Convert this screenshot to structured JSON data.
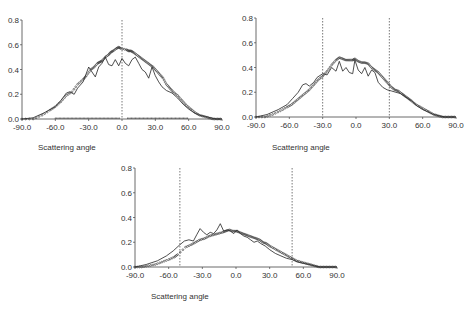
{
  "chart_data": [
    {
      "id": "panel-top-left",
      "type": "line",
      "title": "",
      "xlabel": "Scattering angle",
      "ylabel": "",
      "xlim": [
        -90,
        90
      ],
      "ylim": [
        0,
        0.8
      ],
      "xticks": [
        "-90.0",
        "-60.0",
        "-30.0",
        "0.0",
        "30.0",
        "60.0",
        "90.0"
      ],
      "yticks": [
        "0.0",
        "0.2",
        "0.4",
        "0.6",
        "0.8"
      ],
      "grid": false,
      "legend": "none",
      "vlines": [
        0
      ],
      "box": {
        "x0": 22,
        "x1": 222,
        "y0": 119,
        "y1": 20,
        "label_x": 38,
        "label_y": 150
      },
      "series": [
        {
          "name": "solid-curve",
          "style": "line",
          "x": [
            -90,
            -80,
            -70,
            -60,
            -55,
            -50,
            -47,
            -43,
            -40,
            -35,
            -30,
            -27,
            -24,
            -21,
            -18,
            -15,
            -12,
            -9,
            -6,
            -3,
            0,
            3,
            6,
            9,
            12,
            15,
            18,
            21,
            24,
            27,
            30,
            33,
            36,
            40,
            45,
            50,
            55,
            60,
            65,
            70,
            75,
            80,
            85,
            90
          ],
          "y": [
            0.0,
            0.01,
            0.05,
            0.1,
            0.15,
            0.21,
            0.22,
            0.2,
            0.25,
            0.3,
            0.42,
            0.38,
            0.34,
            0.42,
            0.45,
            0.5,
            0.44,
            0.43,
            0.48,
            0.43,
            0.49,
            0.45,
            0.43,
            0.48,
            0.5,
            0.45,
            0.4,
            0.38,
            0.33,
            0.42,
            0.35,
            0.3,
            0.26,
            0.23,
            0.21,
            0.17,
            0.12,
            0.08,
            0.05,
            0.03,
            0.02,
            0.01,
            0.0,
            0.0
          ]
        },
        {
          "name": "dotted-measurements",
          "style": "points",
          "x": [
            -90,
            -80,
            -72,
            -65,
            -60,
            -55,
            -50,
            -45,
            -40,
            -35,
            -32,
            -28,
            -25,
            -22,
            -20,
            -18,
            -15,
            -12,
            -10,
            -8,
            -5,
            -3,
            -1,
            4,
            6,
            8,
            10,
            13,
            16,
            19,
            22,
            25,
            28,
            31,
            34,
            37,
            40,
            43,
            46,
            50,
            54,
            58,
            62,
            66,
            70,
            74,
            78,
            82,
            86,
            90
          ],
          "y": [
            0.0,
            0.0,
            0.03,
            0.07,
            0.1,
            0.14,
            0.19,
            0.22,
            0.28,
            0.32,
            0.35,
            0.4,
            0.42,
            0.45,
            0.46,
            0.47,
            0.5,
            0.52,
            0.54,
            0.55,
            0.57,
            0.58,
            0.57,
            0.56,
            0.55,
            0.55,
            0.54,
            0.52,
            0.5,
            0.48,
            0.46,
            0.44,
            0.42,
            0.39,
            0.36,
            0.33,
            0.28,
            0.25,
            0.22,
            0.19,
            0.15,
            0.11,
            0.08,
            0.05,
            0.03,
            0.02,
            0.01,
            0.0,
            0.0,
            0.0
          ]
        },
        {
          "name": "baseline-dots",
          "style": "baseline-points",
          "ranges": [
            [
              -60,
              -2
            ],
            [
              5,
              60
            ]
          ]
        }
      ]
    },
    {
      "id": "panel-top-right",
      "type": "line",
      "title": "",
      "xlabel": "Scattering angle",
      "ylabel": "",
      "xlim": [
        -90,
        90
      ],
      "ylim": [
        0,
        0.8
      ],
      "xticks": [
        "-90.0",
        "-60.0",
        "-30.0",
        "0.0",
        "30.0",
        "60.0",
        "90.0"
      ],
      "yticks": [
        "0.0",
        "0.2",
        "0.4",
        "0.6",
        "0.8"
      ],
      "grid": false,
      "legend": "none",
      "vlines": [
        -30,
        30
      ],
      "box": {
        "x0": 256,
        "x1": 456,
        "y0": 117,
        "y1": 18,
        "label_x": 272,
        "label_y": 150
      },
      "series": [
        {
          "name": "solid-curve",
          "style": "line",
          "x": [
            -90,
            -80,
            -70,
            -62,
            -57,
            -52,
            -48,
            -45,
            -42,
            -38,
            -35,
            -30,
            -26,
            -22,
            -18,
            -15,
            -12,
            -9,
            -6,
            -3,
            -1,
            2,
            5,
            8,
            11,
            14,
            17,
            20,
            24,
            28,
            32,
            36,
            40,
            45,
            50,
            55,
            60,
            65,
            70,
            75,
            80,
            85,
            90
          ],
          "y": [
            0.0,
            0.02,
            0.06,
            0.1,
            0.15,
            0.2,
            0.26,
            0.27,
            0.25,
            0.28,
            0.32,
            0.35,
            0.34,
            0.4,
            0.37,
            0.45,
            0.37,
            0.4,
            0.36,
            0.35,
            0.46,
            0.38,
            0.35,
            0.4,
            0.33,
            0.38,
            0.36,
            0.28,
            0.24,
            0.22,
            0.21,
            0.2,
            0.19,
            0.16,
            0.13,
            0.09,
            0.06,
            0.04,
            0.02,
            0.01,
            0.0,
            0.0,
            0.0
          ]
        },
        {
          "name": "dotted-measurements",
          "style": "points",
          "x": [
            -90,
            -82,
            -75,
            -68,
            -62,
            -58,
            -54,
            -50,
            -46,
            -42,
            -38,
            -34,
            -30,
            -26,
            -22,
            -18,
            -15,
            -12,
            -9,
            -6,
            -3,
            -1,
            2,
            5,
            8,
            11,
            14,
            17,
            20,
            23,
            26,
            29,
            32,
            35,
            38,
            41,
            44,
            47,
            50,
            54,
            58,
            62,
            66,
            70,
            74,
            78,
            82,
            86,
            90
          ],
          "y": [
            0.0,
            0.0,
            0.02,
            0.05,
            0.08,
            0.1,
            0.13,
            0.16,
            0.19,
            0.22,
            0.26,
            0.3,
            0.33,
            0.37,
            0.42,
            0.46,
            0.48,
            0.47,
            0.46,
            0.46,
            0.46,
            0.47,
            0.45,
            0.44,
            0.44,
            0.43,
            0.4,
            0.38,
            0.36,
            0.33,
            0.3,
            0.27,
            0.24,
            0.22,
            0.21,
            0.19,
            0.17,
            0.15,
            0.13,
            0.1,
            0.08,
            0.06,
            0.04,
            0.02,
            0.01,
            0.0,
            0.0,
            0.0,
            0.0
          ]
        }
      ]
    },
    {
      "id": "panel-bottom",
      "type": "line",
      "title": "",
      "xlabel": "Scattering angle",
      "ylabel": "",
      "xlim": [
        -90,
        90
      ],
      "ylim": [
        0,
        0.8
      ],
      "xticks": [
        "-90.0",
        "-60.0",
        "-30.0",
        "0.0",
        "30.0",
        "60.0",
        "90.0"
      ],
      "yticks": [
        "0.0",
        "0.2",
        "0.4",
        "0.6",
        "0.8"
      ],
      "grid": false,
      "legend": "none",
      "vlines": [
        -50,
        50
      ],
      "box": {
        "x0": 135,
        "x1": 337,
        "y0": 267,
        "y1": 168,
        "label_x": 151,
        "label_y": 299
      },
      "series": [
        {
          "name": "solid-curve",
          "style": "line",
          "x": [
            -90,
            -80,
            -70,
            -62,
            -56,
            -50,
            -46,
            -42,
            -38,
            -35,
            -32,
            -29,
            -26,
            -23,
            -20,
            -17,
            -14,
            -11,
            -8,
            -5,
            -2,
            1,
            4,
            7,
            10,
            13,
            16,
            19,
            22,
            26,
            30,
            35,
            40,
            45,
            50,
            55,
            60,
            65,
            70,
            75,
            80,
            85,
            90
          ],
          "y": [
            0.0,
            0.02,
            0.05,
            0.09,
            0.13,
            0.18,
            0.21,
            0.22,
            0.21,
            0.26,
            0.31,
            0.28,
            0.26,
            0.28,
            0.27,
            0.3,
            0.35,
            0.29,
            0.3,
            0.29,
            0.27,
            0.3,
            0.27,
            0.25,
            0.24,
            0.22,
            0.2,
            0.21,
            0.19,
            0.17,
            0.14,
            0.11,
            0.09,
            0.07,
            0.06,
            0.04,
            0.03,
            0.02,
            0.01,
            0.0,
            0.0,
            0.0,
            0.0
          ]
        },
        {
          "name": "dotted-measurements",
          "style": "points",
          "x": [
            -90,
            -84,
            -78,
            -72,
            -66,
            -60,
            -55,
            -52,
            -45,
            -40,
            -36,
            -32,
            -28,
            -24,
            -20,
            -16,
            -12,
            -9,
            -6,
            -3,
            0,
            3,
            6,
            9,
            12,
            15,
            18,
            21,
            24,
            27,
            30,
            34,
            38,
            42,
            46,
            50,
            54,
            58,
            62,
            66,
            70,
            74,
            78,
            82,
            86,
            90
          ],
          "y": [
            0.0,
            0.0,
            0.01,
            0.02,
            0.04,
            0.06,
            0.08,
            0.1,
            0.16,
            0.18,
            0.2,
            0.22,
            0.23,
            0.25,
            0.26,
            0.27,
            0.28,
            0.29,
            0.3,
            0.29,
            0.29,
            0.28,
            0.27,
            0.26,
            0.25,
            0.24,
            0.23,
            0.22,
            0.2,
            0.19,
            0.17,
            0.15,
            0.13,
            0.11,
            0.09,
            0.07,
            0.05,
            0.04,
            0.03,
            0.02,
            0.01,
            0.0,
            0.0,
            0.0,
            0.0,
            0.0
          ]
        }
      ]
    }
  ]
}
